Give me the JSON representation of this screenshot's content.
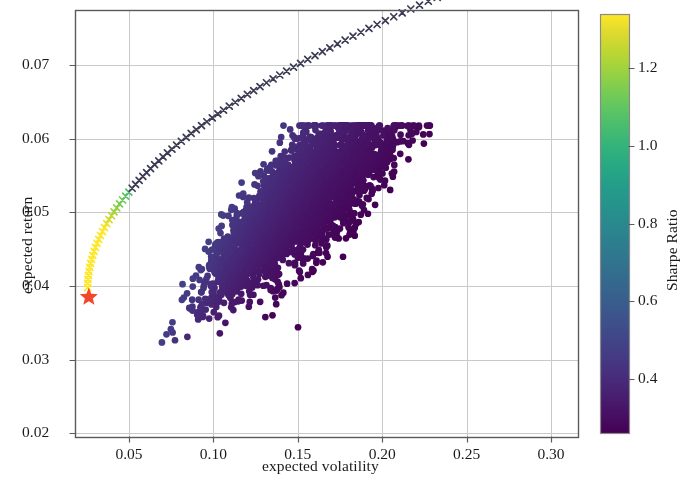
{
  "chart_data": {
    "type": "scatter",
    "title": "",
    "xlabel": "expected volatility",
    "ylabel": "expected return",
    "xlim": [
      0.018,
      0.316
    ],
    "ylim": [
      0.0195,
      0.0775
    ],
    "xticks": [
      0.05,
      0.1,
      0.15,
      0.2,
      0.25,
      0.3
    ],
    "xticklabels": [
      "0.05",
      "0.10",
      "0.15",
      "0.20",
      "0.25",
      "0.30"
    ],
    "yticks": [
      0.02,
      0.03,
      0.04,
      0.05,
      0.06,
      0.07
    ],
    "yticklabels": [
      "0.02",
      "0.03",
      "0.04",
      "0.05",
      "0.06",
      "0.07"
    ],
    "grid": true,
    "grid_color": "#c9c9c9",
    "frame_color": "#5a5a5a",
    "background": "#ffffff",
    "colormap": "viridis",
    "colorbar": {
      "label": "Sharpe Ratio",
      "vmin": 0.26,
      "vmax": 1.34,
      "ticks": [
        0.4,
        0.6,
        0.8,
        1.0,
        1.2
      ],
      "ticklabels": [
        "0.4",
        "0.6",
        "0.8",
        "1.0",
        "1.2"
      ],
      "orientation": "vertical",
      "position": "right"
    },
    "series": [
      {
        "name": "random portfolios",
        "type": "scatter",
        "marker": "o",
        "marker_size": 5.5,
        "color_by": "sharpe_ratio",
        "n_points": 3000,
        "x_range": [
          0.062,
          0.238
        ],
        "y_range": [
          0.0295,
          0.0618
        ],
        "description": "cloud of randomly weighted portfolios coloured by Sharpe ratio; upper-left edge teal/green (high Sharpe ~0.9), dense core dark navy/indigo (Sharpe ~0.3-0.45)"
      },
      {
        "name": "efficient frontier",
        "type": "line+marker",
        "marker": "x",
        "marker_size": 6,
        "color": "#3b3b54",
        "n_points": 80,
        "points": [
          [
            0.0258,
            0.0398
          ],
          [
            0.028,
            0.0413
          ],
          [
            0.0305,
            0.0425
          ],
          [
            0.0334,
            0.0437
          ],
          [
            0.0366,
            0.0448
          ],
          [
            0.04,
            0.0458
          ],
          [
            0.0436,
            0.0468
          ],
          [
            0.0474,
            0.0477
          ],
          [
            0.0513,
            0.0486
          ],
          [
            0.0553,
            0.0494
          ],
          [
            0.0594,
            0.0502
          ],
          [
            0.0636,
            0.051
          ],
          [
            0.0679,
            0.0517
          ],
          [
            0.0723,
            0.0525
          ],
          [
            0.0767,
            0.0532
          ],
          [
            0.0812,
            0.0538
          ],
          [
            0.0858,
            0.0545
          ],
          [
            0.0904,
            0.0551
          ],
          [
            0.0951,
            0.0557
          ],
          [
            0.0998,
            0.0563
          ],
          [
            0.1046,
            0.0569
          ],
          [
            0.1094,
            0.0575
          ],
          [
            0.1143,
            0.058
          ],
          [
            0.1192,
            0.0586
          ],
          [
            0.1241,
            0.0591
          ],
          [
            0.1291,
            0.0596
          ],
          [
            0.1341,
            0.0601
          ],
          [
            0.1392,
            0.0606
          ],
          [
            0.1443,
            0.0611
          ],
          [
            0.1494,
            0.0616
          ],
          [
            0.1546,
            0.062
          ],
          [
            0.1598,
            0.0625
          ],
          [
            0.165,
            0.0629
          ],
          [
            0.1703,
            0.0634
          ],
          [
            0.1756,
            0.0638
          ],
          [
            0.1809,
            0.0642
          ],
          [
            0.1863,
            0.0646
          ],
          [
            0.1917,
            0.065
          ],
          [
            0.1971,
            0.0654
          ],
          [
            0.2026,
            0.0658
          ],
          [
            0.2081,
            0.0662
          ],
          [
            0.2137,
            0.0665
          ],
          [
            0.2193,
            0.0669
          ],
          [
            0.2249,
            0.0672
          ],
          [
            0.2306,
            0.0676
          ],
          [
            0.2363,
            0.0679
          ],
          [
            0.2421,
            0.0683
          ],
          [
            0.2479,
            0.0686
          ],
          [
            0.2538,
            0.0689
          ],
          [
            0.2597,
            0.0692
          ],
          [
            0.2657,
            0.0695
          ],
          [
            0.2718,
            0.0698
          ],
          [
            0.2779,
            0.0701
          ],
          [
            0.2841,
            0.0704
          ],
          [
            0.2904,
            0.0707
          ],
          [
            0.235,
            0.069
          ],
          [
            0.244,
            0.0697
          ],
          [
            0.253,
            0.0704
          ],
          [
            0.262,
            0.0712
          ],
          [
            0.271,
            0.0719
          ],
          [
            0.28,
            0.0727
          ],
          [
            0.289,
            0.0734
          ],
          [
            0.294,
            0.0744
          ]
        ],
        "description": "minimum-variance efficient frontier traced with x markers, dense near the left tip and increasingly sparse toward the right"
      },
      {
        "name": "minimum volatility portfolio",
        "type": "marker",
        "marker": "*",
        "marker_size": 19,
        "color": "#f4462a",
        "points": [
          [
            0.0262,
            0.0385
          ]
        ]
      }
    ]
  },
  "figure": {
    "width": 685,
    "height": 484
  }
}
